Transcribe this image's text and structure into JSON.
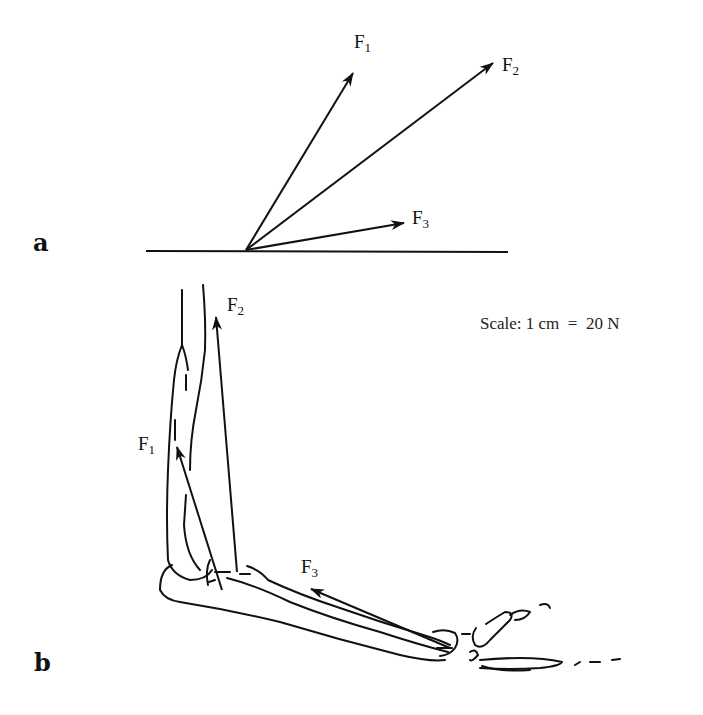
{
  "panels": {
    "a": {
      "label": "a",
      "forces": [
        {
          "name": "F",
          "sub": "1"
        },
        {
          "name": "F",
          "sub": "2"
        },
        {
          "name": "F",
          "sub": "3"
        }
      ]
    },
    "b": {
      "label": "b",
      "forces": [
        {
          "name": "F",
          "sub": "1"
        },
        {
          "name": "F",
          "sub": "2"
        },
        {
          "name": "F",
          "sub": "3"
        }
      ],
      "scale_text": "Scale: 1 cm  =  20 N"
    }
  },
  "colors": {
    "ink": "#111111",
    "background": "#ffffff"
  }
}
